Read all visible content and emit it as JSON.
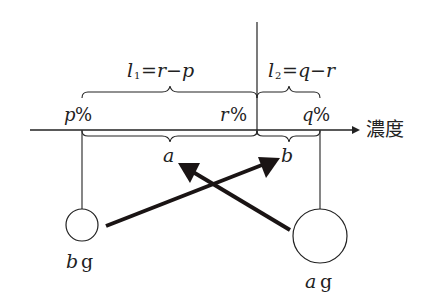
{
  "diagram": {
    "axis_label": "濃度",
    "points": {
      "p": {
        "label": "p",
        "unit": "%"
      },
      "r": {
        "label": "r",
        "unit": "%"
      },
      "q": {
        "label": "q",
        "unit": "%"
      }
    },
    "top_braces": {
      "l1": {
        "var": "l",
        "sub": "1",
        "expr": "=r−p"
      },
      "l2": {
        "var": "l",
        "sub": "2",
        "expr": "=q−r"
      }
    },
    "bottom_braces": {
      "a": "a",
      "b": "b"
    },
    "weights": {
      "left": {
        "var": "b",
        "unit": "g"
      },
      "right": {
        "var": "a",
        "unit": "g"
      }
    },
    "colors": {
      "ink": "#222222",
      "arrow": "#1a1414"
    }
  }
}
